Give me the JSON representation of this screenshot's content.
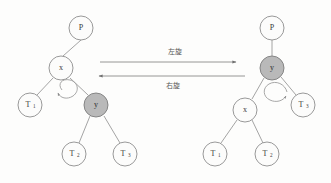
{
  "diagram": {
    "title_visible": false,
    "background_color": "#fdfdfc",
    "node_fill_plain": "#fcfcfb",
    "node_fill_shaded": "#b9b9b9",
    "stroke_color": "#8d8d8d"
  },
  "left_tree": {
    "name": "before-rotation-tree",
    "nodes": [
      {
        "id": "p",
        "label": "P",
        "subscript": "",
        "shaded": false,
        "cx": 81,
        "cy": 28,
        "r": 12
      },
      {
        "id": "x",
        "label": "x",
        "subscript": "",
        "shaded": false,
        "cx": 61,
        "cy": 68,
        "r": 12
      },
      {
        "id": "t1",
        "label": "T",
        "subscript": "1",
        "shaded": false,
        "cx": 30,
        "cy": 105,
        "r": 12
      },
      {
        "id": "y",
        "label": "y",
        "subscript": "",
        "shaded": true,
        "cx": 96,
        "cy": 105,
        "r": 12
      },
      {
        "id": "t2",
        "label": "T",
        "subscript": "2",
        "shaded": false,
        "cx": 74,
        "cy": 154,
        "r": 12
      },
      {
        "id": "t3",
        "label": "T",
        "subscript": "3",
        "shaded": false,
        "cx": 125,
        "cy": 154,
        "r": 12
      }
    ],
    "edges": [
      {
        "from": "p",
        "to": "x"
      },
      {
        "from": "x",
        "to": "t1"
      },
      {
        "from": "x",
        "to": "y"
      },
      {
        "from": "y",
        "to": "t2"
      },
      {
        "from": "y",
        "to": "t3"
      }
    ],
    "loop": {
      "direction": "counterclockwise",
      "cx": 68,
      "cy": 95
    }
  },
  "right_tree": {
    "name": "after-rotation-tree",
    "nodes": [
      {
        "id": "p",
        "label": "P",
        "subscript": "",
        "shaded": false,
        "cx": 272,
        "cy": 28,
        "r": 12
      },
      {
        "id": "y",
        "label": "y",
        "subscript": "",
        "shaded": true,
        "cx": 272,
        "cy": 68,
        "r": 12
      },
      {
        "id": "x",
        "label": "x",
        "subscript": "",
        "shaded": false,
        "cx": 245,
        "cy": 110,
        "r": 12
      },
      {
        "id": "t3",
        "label": "T",
        "subscript": "3",
        "shaded": false,
        "cx": 303,
        "cy": 105,
        "r": 12
      },
      {
        "id": "t1",
        "label": "T",
        "subscript": "1",
        "shaded": false,
        "cx": 215,
        "cy": 154,
        "r": 12
      },
      {
        "id": "t2",
        "label": "T",
        "subscript": "2",
        "shaded": false,
        "cx": 267,
        "cy": 154,
        "r": 12
      }
    ],
    "edges": [
      {
        "from": "p",
        "to": "y"
      },
      {
        "from": "y",
        "to": "x"
      },
      {
        "from": "y",
        "to": "t3"
      },
      {
        "from": "x",
        "to": "t1"
      },
      {
        "from": "x",
        "to": "t2"
      }
    ],
    "loop": {
      "direction": "clockwise",
      "cx": 278,
      "cy": 97
    }
  },
  "arrows": {
    "left_rotation": {
      "label": "左旋",
      "direction": "right",
      "x1": 100,
      "x2": 238,
      "y": 62
    },
    "right_rotation": {
      "label": "右旋",
      "direction": "left",
      "x1": 245,
      "x2": 97,
      "y": 76
    }
  }
}
